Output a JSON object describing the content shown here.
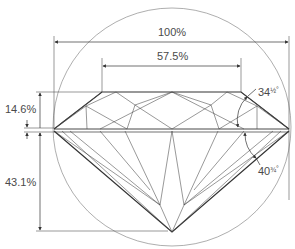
{
  "diagram": {
    "labels": {
      "total_width": "100%",
      "table_width": "57.5%",
      "crown_height": "14.6%",
      "pavilion_depth": "43.1%",
      "crown_angle_whole": "34",
      "crown_angle_frac": "½",
      "crown_angle_unit": "°",
      "pavilion_angle_whole": "40",
      "pavilion_angle_frac": "¾",
      "pavilion_angle_unit": "°"
    },
    "colors": {
      "line": "#333333",
      "thin_line": "#555555",
      "text": "#4a4a4a",
      "background": "#ffffff"
    }
  }
}
